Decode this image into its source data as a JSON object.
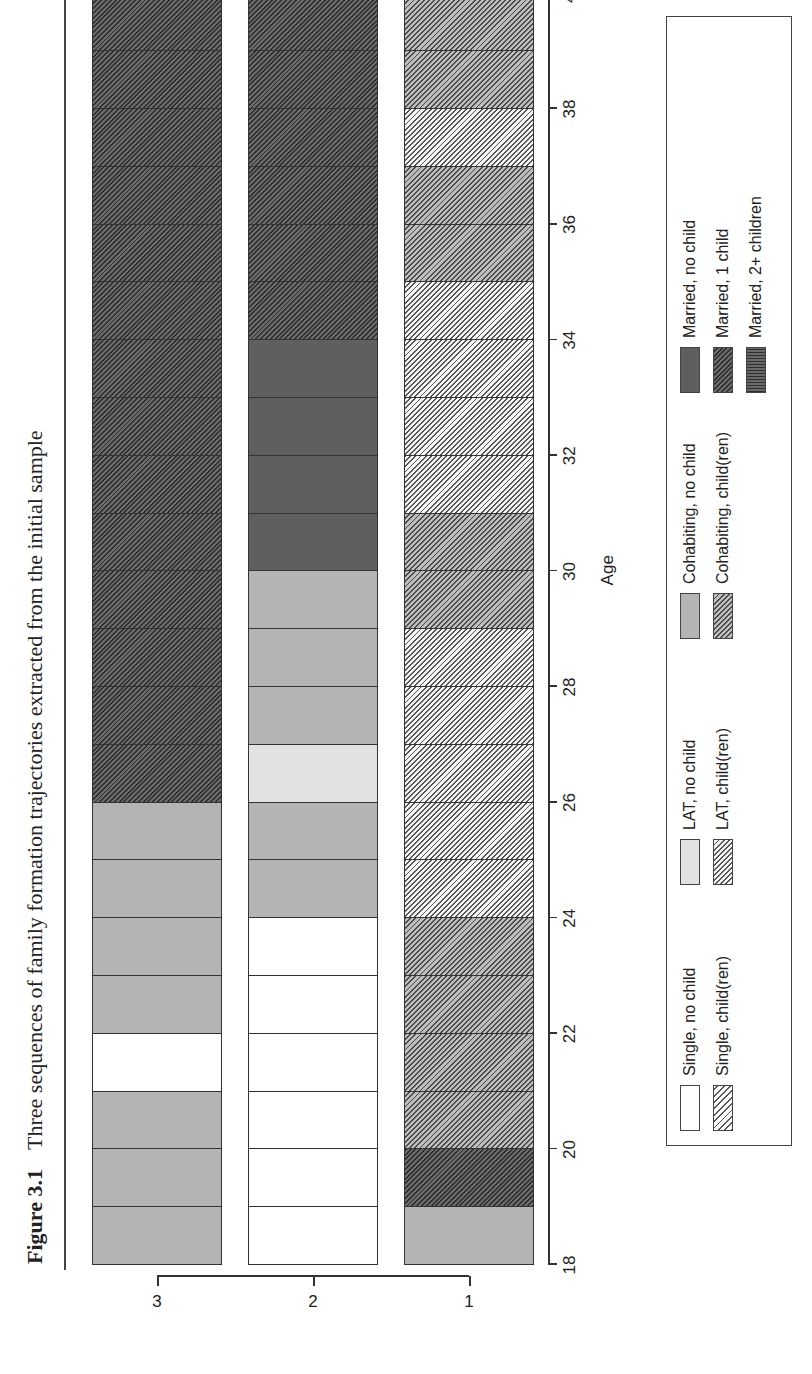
{
  "caption": {
    "figure_label": "Figure 3.1",
    "title": "Three sequences of family formation trajectories extracted from the initial sample"
  },
  "states": {
    "single_nc": "Single, no child",
    "single_ch": "Single, child(ren)",
    "lat_nc": "LAT, no child",
    "lat_ch": "LAT, child(ren)",
    "cohab_nc": "Cohabiting, no child",
    "cohab_ch": "Cohabiting, child(ren)",
    "married_nc": "Married, no child",
    "married_1c": "Married, 1 child",
    "married_2c": "Married, 2+ children"
  },
  "legend": {
    "columns": [
      [
        {
          "key": "single_nc",
          "label": "Single, no child"
        },
        {
          "key": "single_ch",
          "label": "Single, child(ren)"
        }
      ],
      [
        {
          "key": "lat_nc",
          "label": "LAT, no child"
        },
        {
          "key": "lat_ch",
          "label": "LAT, child(ren)"
        }
      ],
      [
        {
          "key": "cohab_nc",
          "label": "Cohabiting, no child"
        },
        {
          "key": "cohab_ch",
          "label": "Cohabiting, child(ren)"
        }
      ],
      [
        {
          "key": "married_nc",
          "label": "Married, no child"
        },
        {
          "key": "married_1c",
          "label": "Married, 1 child"
        },
        {
          "key": "married_2c",
          "label": "Married, 2+ children"
        }
      ]
    ]
  },
  "axes": {
    "xlabel": "Age",
    "xticks": [
      18,
      20,
      22,
      24,
      26,
      28,
      30,
      32,
      34,
      36,
      38,
      40
    ],
    "yticks": [
      "1",
      "2",
      "3"
    ]
  },
  "chart_data": {
    "type": "sequence_index_plot",
    "title": "Three sequences of family formation trajectories extracted from the initial sample",
    "xlabel": "Age",
    "ylabel": "",
    "xlim": [
      18,
      40
    ],
    "orientation_note": "printed rotated 90 degrees counter-clockwise",
    "x": [
      18,
      19,
      20,
      21,
      22,
      23,
      24,
      25,
      26,
      27,
      28,
      29,
      30,
      31,
      32,
      33,
      34,
      35,
      36,
      37,
      38,
      39
    ],
    "legend_position": "right (bottom of rotated figure)",
    "series": [
      {
        "name": "1",
        "values": [
          "cohab_nc",
          "married_1c",
          "cohab_ch",
          "cohab_ch",
          "cohab_ch",
          "cohab_ch",
          "lat_ch",
          "lat_ch",
          "lat_ch",
          "lat_ch",
          "lat_ch",
          "cohab_ch",
          "cohab_ch",
          "lat_ch",
          "lat_ch",
          "lat_ch",
          "lat_ch",
          "cohab_ch",
          "cohab_ch",
          "lat_ch",
          "cohab_ch",
          "cohab_ch"
        ]
      },
      {
        "name": "2",
        "values": [
          "single_nc",
          "single_nc",
          "single_nc",
          "single_nc",
          "single_nc",
          "single_nc",
          "cohab_nc",
          "cohab_nc",
          "lat_nc",
          "cohab_nc",
          "cohab_nc",
          "cohab_nc",
          "married_nc",
          "married_nc",
          "married_nc",
          "married_nc",
          "married_1c",
          "married_1c",
          "married_1c",
          "married_1c",
          "married_1c",
          "married_1c"
        ]
      },
      {
        "name": "3",
        "values": [
          "cohab_nc",
          "cohab_nc",
          "cohab_nc",
          "single_nc",
          "cohab_nc",
          "cohab_nc",
          "cohab_nc",
          "cohab_nc",
          "married_1c",
          "married_1c",
          "married_1c",
          "married_1c",
          "married_1c",
          "married_1c",
          "married_1c",
          "married_1c",
          "married_1c",
          "married_1c",
          "married_1c",
          "married_1c",
          "married_1c",
          "married_1c"
        ]
      }
    ]
  }
}
